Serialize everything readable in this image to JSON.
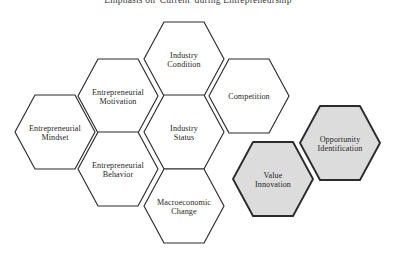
{
  "figure": {
    "title": "Emphasis on 'Current' during Entrepreneurship",
    "type": "honeycomb-hexagon-diagram",
    "background_color": "#ffffff",
    "outline_color": "#2b2b2b",
    "shaded_fill_color": "#dcdcdc",
    "plain_fill_color": "#ffffff"
  },
  "nodes": [
    {
      "id": "entrepreneurial-mindset",
      "label_line1": "Entrepreneurial",
      "label_line2": "Mindset",
      "style": "plain",
      "cx": 55,
      "cy": 132
    },
    {
      "id": "entrepreneurial-motivation",
      "label_line1": "Entrepreneurial",
      "label_line2": "Motivation",
      "style": "plain",
      "cx": 118,
      "cy": 96
    },
    {
      "id": "entrepreneurial-behavior",
      "label_line1": "Entrepreneurial",
      "label_line2": "Behavior",
      "style": "plain",
      "cx": 118,
      "cy": 169
    },
    {
      "id": "industry-condition",
      "label_line1": "Industry",
      "label_line2": "Condition",
      "style": "plain",
      "cx": 184,
      "cy": 59
    },
    {
      "id": "industry-status",
      "label_line1": "Industry",
      "label_line2": "Status",
      "style": "plain",
      "cx": 184,
      "cy": 132
    },
    {
      "id": "macroeconomic-change",
      "label_line1": "Macroeconomic",
      "label_line2": "Change",
      "style": "plain",
      "cx": 184,
      "cy": 206
    },
    {
      "id": "competition",
      "label_line1": "Competition",
      "label_line2": "",
      "style": "plain",
      "cx": 249,
      "cy": 96
    },
    {
      "id": "value-innovation",
      "label_line1": "Value",
      "label_line2": "Innovation",
      "style": "shaded",
      "cx": 273,
      "cy": 179
    },
    {
      "id": "opportunity-identification",
      "label_line1": "Opportunity",
      "label_line2": "Identification",
      "style": "shaded",
      "cx": 340,
      "cy": 143
    }
  ]
}
